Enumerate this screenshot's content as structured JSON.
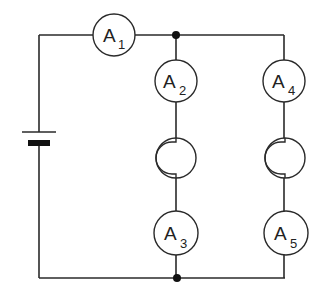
{
  "diagram": {
    "type": "circuit",
    "colors": {
      "line": "#2a2a2a",
      "background": "#ffffff",
      "junction": "#111111"
    },
    "ammeters": [
      {
        "id": "A1",
        "letter": "A",
        "subscript": "1"
      },
      {
        "id": "A2",
        "letter": "A",
        "subscript": "2"
      },
      {
        "id": "A3",
        "letter": "A",
        "subscript": "3"
      },
      {
        "id": "A4",
        "letter": "A",
        "subscript": "4"
      },
      {
        "id": "A5",
        "letter": "A",
        "subscript": "5"
      }
    ],
    "lamps": [
      {
        "id": "lamp-left-branch"
      },
      {
        "id": "lamp-right-branch"
      }
    ],
    "battery": {
      "id": "cell"
    },
    "junctions": [
      {
        "id": "top-junction"
      },
      {
        "id": "bottom-junction"
      }
    ]
  }
}
